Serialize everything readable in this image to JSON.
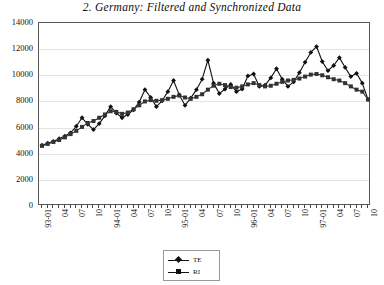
{
  "chart_data": {
    "type": "line",
    "title": "2. Germany: Filtered and Synchronized Data",
    "xlabel": "",
    "ylabel": "",
    "ylim": [
      0,
      14000
    ],
    "ytick_values": [
      0,
      2000,
      4000,
      6000,
      8000,
      10000,
      12000,
      14000
    ],
    "ytick_labels": [
      "0",
      "2000",
      "4000",
      "6000",
      "8000",
      "10000",
      "12000",
      "14000"
    ],
    "grid": true,
    "legend_position": "bottom-center",
    "x": [
      "93-01",
      "93-02",
      "93-03",
      "93-04",
      "93-05",
      "93-06",
      "93-07",
      "93-08",
      "93-09",
      "93-10",
      "93-11",
      "93-12",
      "94-01",
      "94-02",
      "94-03",
      "94-04",
      "94-05",
      "94-06",
      "94-07",
      "94-08",
      "94-09",
      "94-10",
      "94-11",
      "94-12",
      "95-01",
      "95-02",
      "95-03",
      "95-04",
      "95-05",
      "95-06",
      "95-07",
      "95-08",
      "95-09",
      "95-10",
      "95-11",
      "95-12",
      "96-01",
      "96-02",
      "96-03",
      "96-04",
      "96-05",
      "96-06",
      "96-07",
      "96-08",
      "96-09",
      "96-10",
      "96-11",
      "96-12",
      "97-01",
      "97-02",
      "97-03",
      "97-04",
      "97-05",
      "97-06",
      "97-07",
      "97-08",
      "97-09",
      "97-10"
    ],
    "xtick_labels": [
      "93-01",
      "",
      "",
      "04",
      "",
      "",
      "07",
      "",
      "",
      "10",
      "",
      "",
      "94-01",
      "",
      "",
      "04",
      "",
      "",
      "07",
      "",
      "",
      "10",
      "",
      "",
      "95-01",
      "",
      "",
      "04",
      "",
      "",
      "07",
      "",
      "",
      "10",
      "",
      "",
      "96-01",
      "",
      "",
      "04",
      "",
      "",
      "07",
      "",
      "",
      "10",
      "",
      "",
      "97-01",
      "",
      "",
      "04",
      "",
      "",
      "07",
      "",
      "",
      "10"
    ],
    "xtick_labels_shown": [
      "93-01",
      "04",
      "07",
      "10",
      "94-01",
      "04",
      "07",
      "10",
      "95-01",
      "04",
      "07",
      "10",
      "96-01",
      "04",
      "07",
      "10",
      "97-01",
      "04",
      "07",
      "10"
    ],
    "series": [
      {
        "name": "TE",
        "marker": "diamond",
        "color": "#111111",
        "values": [
          4650,
          4800,
          4950,
          5150,
          5350,
          5600,
          6100,
          6750,
          6250,
          5850,
          6300,
          6900,
          7600,
          7100,
          6750,
          7000,
          7350,
          7950,
          8900,
          8300,
          7600,
          8050,
          8750,
          9600,
          8500,
          7700,
          8250,
          8900,
          9700,
          11150,
          9400,
          8600,
          8950,
          9300,
          8750,
          8950,
          9950,
          10100,
          9150,
          9250,
          9800,
          10500,
          9700,
          9150,
          9500,
          10200,
          11000,
          11750,
          12200,
          11050,
          10350,
          10750,
          11350,
          10600,
          9900,
          10150,
          9400,
          8150
        ]
      },
      {
        "name": "RI",
        "marker": "square",
        "color": "#333333",
        "values": [
          4600,
          4750,
          4900,
          5050,
          5250,
          5500,
          5750,
          6050,
          6350,
          6500,
          6750,
          7000,
          7250,
          7200,
          7050,
          7150,
          7400,
          7700,
          8000,
          8100,
          8050,
          8100,
          8200,
          8350,
          8450,
          8300,
          8200,
          8350,
          8550,
          8900,
          9200,
          9350,
          9250,
          9100,
          9050,
          9150,
          9300,
          9400,
          9250,
          9150,
          9200,
          9350,
          9500,
          9600,
          9650,
          9750,
          9900,
          10050,
          10100,
          10000,
          9850,
          9700,
          9600,
          9400,
          9150,
          8900,
          8750,
          8150
        ]
      }
    ]
  },
  "legend": {
    "items": [
      {
        "label": "TE"
      },
      {
        "label": "RI"
      }
    ]
  }
}
